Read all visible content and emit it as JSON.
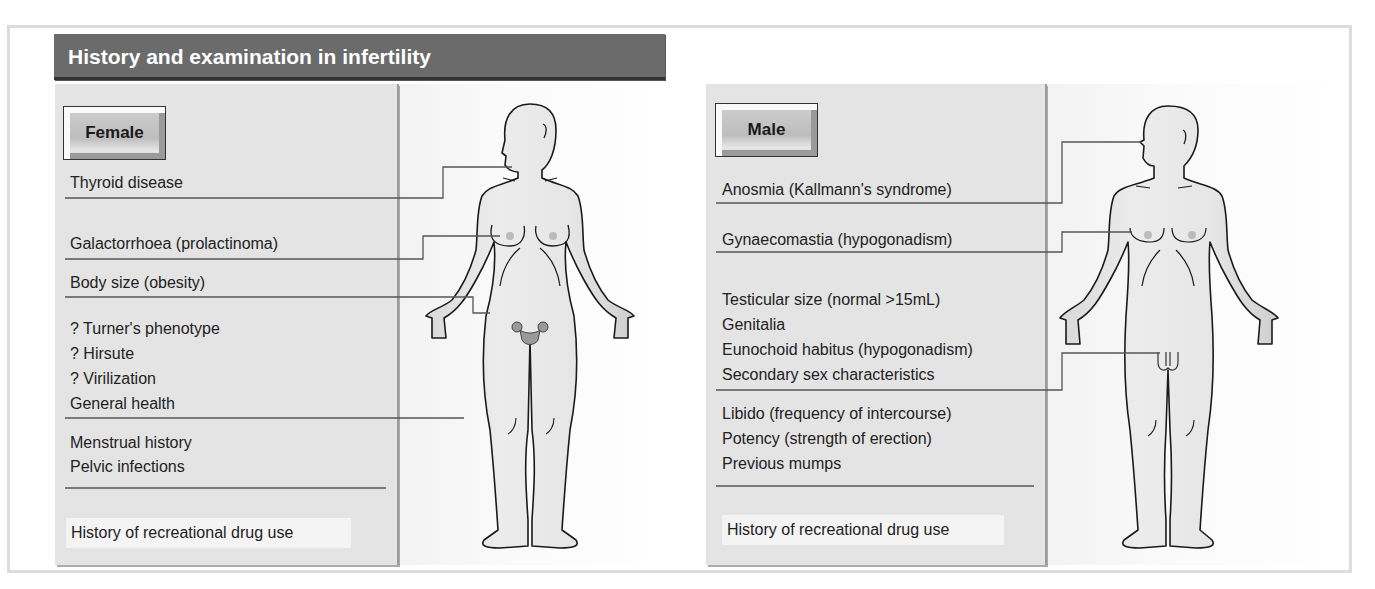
{
  "title": "History and examination in infertility",
  "female": {
    "label": "Female",
    "items": [
      {
        "text": "Thyroid disease"
      },
      {
        "text": "Galactorrhoea (prolactinoma)"
      },
      {
        "text": "Body size (obesity)"
      },
      {
        "text": "? Turner's phenotype"
      },
      {
        "text": "? Hirsute"
      },
      {
        "text": "? Virilization"
      },
      {
        "text": "General health"
      },
      {
        "text": "Menstrual history"
      },
      {
        "text": "Pelvic infections"
      }
    ],
    "drug_history": "History of recreational drug use"
  },
  "male": {
    "label": "Male",
    "items": [
      {
        "text": "Anosmia (Kallmann's syndrome)"
      },
      {
        "text": "Gynaecomastia (hypogonadism)"
      },
      {
        "text": "Testicular size (normal >15mL)"
      },
      {
        "text": "Genitalia"
      },
      {
        "text": "Eunochoid habitus (hypogonadism)"
      },
      {
        "text": "Secondary sex characteristics"
      },
      {
        "text": "Libido (frequency of intercourse)"
      },
      {
        "text": "Potency (strength of erection)"
      },
      {
        "text": "Previous mumps"
      }
    ],
    "drug_history": "History of recreational drug use"
  },
  "colors": {
    "header_bg": "#6b6b6b",
    "panel_bg": "#e4e4e4",
    "line": "#555555"
  }
}
